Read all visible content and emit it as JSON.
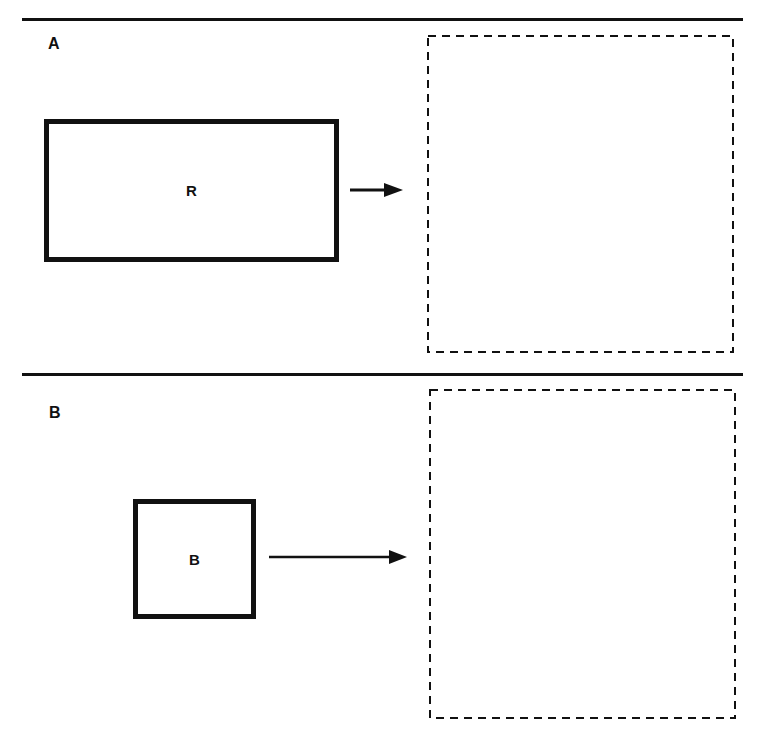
{
  "panels": [
    {
      "label": "A",
      "shape": {
        "kind": "rectangle",
        "label": "R"
      },
      "arrow": "right-arrow",
      "answer_box": {
        "style": "dashed",
        "content": ""
      }
    },
    {
      "label": "B",
      "shape": {
        "kind": "square",
        "label": "B"
      },
      "arrow": "right-arrow",
      "answer_box": {
        "style": "dashed",
        "content": ""
      }
    }
  ],
  "colors": {
    "ink": "#111111",
    "background": "#ffffff"
  }
}
